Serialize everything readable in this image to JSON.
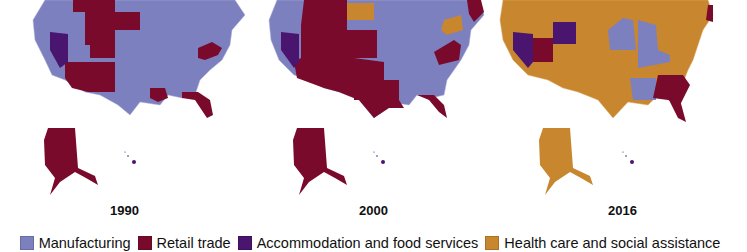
{
  "colors": {
    "manufacturing": "#7d80bf",
    "retail": "#7a0a2c",
    "accommodation": "#4a156e",
    "health": "#c8862e"
  },
  "panels": [
    {
      "year": "1990",
      "base": "manufacturing",
      "alaska": "retail",
      "hawaii": "accommodation"
    },
    {
      "year": "2000",
      "base": "manufacturing",
      "alaska": "retail",
      "hawaii": "accommodation"
    },
    {
      "year": "2016",
      "base": "health",
      "alaska": "health",
      "hawaii": "accommodation"
    }
  ],
  "legend": [
    {
      "label": "Manufacturing",
      "color": "#7d80bf"
    },
    {
      "label": "Retail trade",
      "color": "#7a0a2c"
    },
    {
      "label": "Accommodation and food services",
      "color": "#4a156e"
    },
    {
      "label": "Health care and social assistance",
      "color": "#c8862e"
    }
  ]
}
